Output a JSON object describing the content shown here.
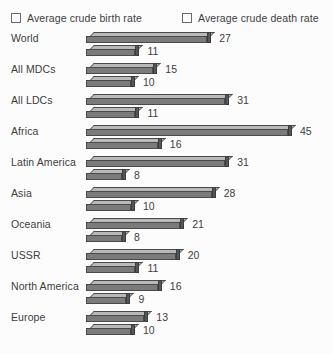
{
  "legend": {
    "birth": {
      "label": "Average crude birth rate",
      "swatch_color": "#b9b9b9",
      "icon": "legend-swatch-icon"
    },
    "death": {
      "label": "Average crude death rate",
      "swatch_color": "#b9b9b9",
      "icon": "legend-swatch-icon"
    }
  },
  "chart_data": {
    "type": "bar",
    "orientation": "horizontal",
    "title": "",
    "xlabel": "",
    "ylabel": "",
    "grid": false,
    "legend_position": "top",
    "xlim": [
      0,
      45
    ],
    "categories": [
      "World",
      "All MDCs",
      "All LDCs",
      "Africa",
      "Latin America",
      "Asia",
      "Oceania",
      "USSR",
      "North America",
      "Europe"
    ],
    "series": [
      {
        "name": "Average crude birth rate",
        "values": [
          27,
          15,
          31,
          45,
          31,
          28,
          21,
          20,
          16,
          13
        ]
      },
      {
        "name": "Average crude death rate",
        "values": [
          11,
          10,
          11,
          16,
          8,
          10,
          8,
          11,
          9,
          10
        ]
      }
    ]
  }
}
